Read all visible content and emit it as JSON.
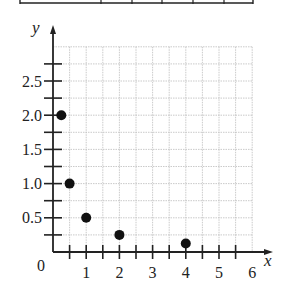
{
  "chart_data": {
    "type": "scatter",
    "title": "",
    "xlabel": "x",
    "ylabel": "y",
    "xlim": [
      0,
      6
    ],
    "ylim": [
      0,
      3
    ],
    "grid": true,
    "legend": null,
    "x_ticks": [
      1,
      2,
      3,
      4,
      5,
      6
    ],
    "x_tick_labels": [
      "1",
      "2",
      "3",
      "4",
      "5",
      "6"
    ],
    "x_minor_step": 0.5,
    "y_ticks": [
      0.5,
      1.0,
      1.5,
      2.0,
      2.5
    ],
    "y_tick_labels": [
      "0.5",
      "1.0",
      "1.5",
      "2.0",
      "2.5"
    ],
    "y_minor_step": 0.25,
    "origin_label": "0",
    "series": [
      {
        "name": "points",
        "x": [
          0.25,
          0.5,
          1,
          2,
          4
        ],
        "y": [
          2.0,
          1.0,
          0.5,
          0.25,
          0.125
        ]
      }
    ]
  },
  "table_fragment": {
    "note": "bottom edge of a table cropped at top of image",
    "column_dividers_px": [
      101,
      132,
      162,
      193,
      224
    ]
  },
  "colors": {
    "axis": "#222222",
    "grid": "#bdbdbd",
    "point": "#111111"
  }
}
